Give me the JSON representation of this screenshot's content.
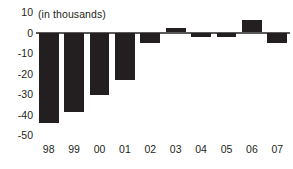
{
  "chart_data": {
    "type": "bar",
    "title": "(in thousands)",
    "xlabel": "",
    "ylabel": "",
    "categories": [
      "98",
      "99",
      "00",
      "01",
      "02",
      "03",
      "04",
      "05",
      "06",
      "07"
    ],
    "values": [
      -44,
      -39,
      -30.5,
      -23,
      -5,
      2,
      -2,
      -2,
      6,
      -5
    ],
    "series": [
      {
        "name": "",
        "values": [
          -44,
          -39,
          -30.5,
          -23,
          -5,
          2,
          -2,
          -2,
          6,
          -5
        ]
      }
    ],
    "ylim": [
      -50,
      10
    ],
    "ytick_labels": [
      "10",
      "0",
      "-10",
      "-20",
      "-30",
      "-40",
      "-50"
    ],
    "ytick_values": [
      10,
      0,
      -10,
      -20,
      -30,
      -40,
      -50
    ],
    "grid": false,
    "legend": "none",
    "bar_color": "#231f20",
    "axis_color": "#5a5a5a",
    "text_color": "#231f20",
    "background": "#ffffff"
  }
}
